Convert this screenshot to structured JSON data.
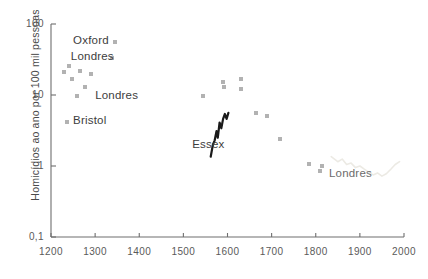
{
  "chart_data": {
    "type": "scatter",
    "title": "",
    "xlabel": "",
    "ylabel": "Homicídios ao ano por 100 mil pessoas",
    "xlim": [
      1200,
      2000
    ],
    "ylim": [
      0.1,
      100
    ],
    "yscale": "log",
    "grid": false,
    "legend": "none",
    "xticks": [
      "1200",
      "1300",
      "1400",
      "1500",
      "1600",
      "1700",
      "1800",
      "1900",
      "2000"
    ],
    "yticks": [
      "100",
      "10",
      "1",
      "0,1"
    ],
    "annotations": [
      {
        "text": "Oxford",
        "x": 1250,
        "y": 55
      },
      {
        "text": "Londres",
        "x": 1245,
        "y": 33
      },
      {
        "text": "Londres",
        "x": 1300,
        "y": 9.5
      },
      {
        "text": "Bristol",
        "x": 1250,
        "y": 4.2
      },
      {
        "text": "Essex",
        "x": 1520,
        "y": 1.9
      },
      {
        "text": "Londres",
        "x": 1830,
        "y": 0.75
      }
    ],
    "series": [
      {
        "name": "estimativas medievais e modernas",
        "type": "scatter",
        "points": [
          {
            "x": 1230,
            "y": 21
          },
          {
            "x": 1240,
            "y": 26
          },
          {
            "x": 1247,
            "y": 17
          },
          {
            "x": 1265,
            "y": 22
          },
          {
            "x": 1278,
            "y": 13
          },
          {
            "x": 1290,
            "y": 20
          },
          {
            "x": 1258,
            "y": 9.6
          },
          {
            "x": 1237,
            "y": 4.1
          },
          {
            "x": 1345,
            "y": 55
          },
          {
            "x": 1338,
            "y": 33
          },
          {
            "x": 1545,
            "y": 9.8
          },
          {
            "x": 1590,
            "y": 15
          },
          {
            "x": 1592,
            "y": 13
          },
          {
            "x": 1630,
            "y": 17
          },
          {
            "x": 1630,
            "y": 12
          },
          {
            "x": 1665,
            "y": 5.6
          },
          {
            "x": 1690,
            "y": 5.0
          },
          {
            "x": 1720,
            "y": 2.4
          },
          {
            "x": 1785,
            "y": 1.05
          },
          {
            "x": 1815,
            "y": 1.0
          },
          {
            "x": 1810,
            "y": 0.85
          }
        ]
      },
      {
        "name": "Essex",
        "type": "line",
        "color": "#1a1a1a",
        "points": [
          {
            "x": 1562,
            "y": 1.35
          },
          {
            "x": 1567,
            "y": 2.0
          },
          {
            "x": 1571,
            "y": 2.3
          },
          {
            "x": 1575,
            "y": 3.1
          },
          {
            "x": 1578,
            "y": 2.5
          },
          {
            "x": 1582,
            "y": 4.1
          },
          {
            "x": 1586,
            "y": 3.4
          },
          {
            "x": 1590,
            "y": 4.6
          },
          {
            "x": 1594,
            "y": 5.4
          },
          {
            "x": 1598,
            "y": 4.6
          },
          {
            "x": 1602,
            "y": 5.6
          }
        ]
      },
      {
        "name": "Londres (séculos XIX-XX)",
        "type": "line",
        "color": "#eceae4",
        "points": [
          {
            "x": 1835,
            "y": 1.35
          },
          {
            "x": 1850,
            "y": 1.15
          },
          {
            "x": 1860,
            "y": 1.25
          },
          {
            "x": 1870,
            "y": 1.05
          },
          {
            "x": 1880,
            "y": 1.1
          },
          {
            "x": 1890,
            "y": 0.95
          },
          {
            "x": 1900,
            "y": 1.0
          },
          {
            "x": 1910,
            "y": 0.9
          },
          {
            "x": 1920,
            "y": 0.82
          },
          {
            "x": 1930,
            "y": 0.75
          },
          {
            "x": 1940,
            "y": 0.8
          },
          {
            "x": 1950,
            "y": 0.72
          },
          {
            "x": 1960,
            "y": 0.78
          },
          {
            "x": 1970,
            "y": 0.9
          },
          {
            "x": 1980,
            "y": 1.05
          },
          {
            "x": 1990,
            "y": 1.15
          }
        ]
      }
    ]
  }
}
